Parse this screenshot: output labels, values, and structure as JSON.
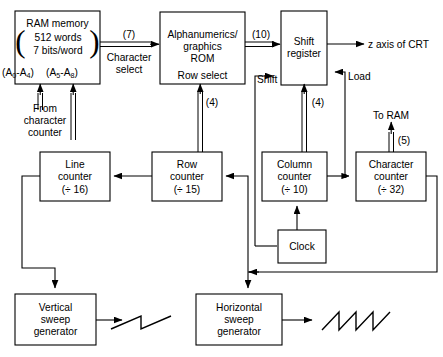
{
  "diagram": {
    "blocks": {
      "ram": {
        "line1": "RAM memory",
        "line2": "512 words",
        "line3": "7 bits/word",
        "addr_low_pre": "(A",
        "addr_low_sub1": "0",
        "addr_low_mid": "-A",
        "addr_low_sub2": "4",
        "addr_low_post": ")",
        "addr_high_pre": "(A",
        "addr_high_sub1": "5",
        "addr_high_mid": "-A",
        "addr_high_sub2": "8",
        "addr_high_post": ")"
      },
      "rom": {
        "line1": "Alphanumerics/",
        "line2": "graphics",
        "line3": "ROM",
        "line4": "Row select"
      },
      "shift_register": {
        "line1": "Shift",
        "line2": "register"
      },
      "line_counter": {
        "line1": "Line",
        "line2": "counter",
        "line3": "(÷ 16)"
      },
      "row_counter": {
        "line1": "Row",
        "line2": "counter",
        "line3": "(÷ 15)"
      },
      "column_counter": {
        "line1": "Column",
        "line2": "counter",
        "line3": "(÷ 10)"
      },
      "character_counter": {
        "line1": "Character",
        "line2": "counter",
        "line3": "(÷ 32)"
      },
      "clock": {
        "line1": "Clock"
      },
      "vertical_sweep": {
        "line1": "Vertical",
        "line2": "sweep",
        "line3": "generator"
      },
      "horizontal_sweep": {
        "line1": "Horizontal",
        "line2": "sweep",
        "line3": "generator"
      }
    },
    "labels": {
      "bus7": "(7)",
      "character_select_l1": "Character",
      "character_select_l2": "select",
      "bus10": "(10)",
      "z_axis": "z axis of CRT",
      "shift": "Shift",
      "load": "Load",
      "bus4_rom": "(4)",
      "bus4_sr": "(4)",
      "bus5": "(5)",
      "to_ram": "To RAM",
      "from_char_l1": "From",
      "from_char_l2": "character",
      "from_char_l3": "counter"
    },
    "colors": {
      "line": "#000000",
      "background": "#ffffff",
      "fill": "#ffffff"
    }
  }
}
